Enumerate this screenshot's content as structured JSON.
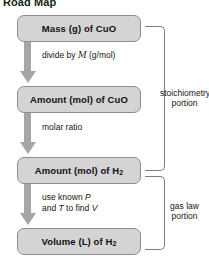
{
  "title": "Road Map",
  "nodes": [
    {
      "id": "mass-cuo",
      "text": "Mass (g) of CuO"
    },
    {
      "id": "mol-cuo",
      "text": "Amount (mol) of CuO"
    },
    {
      "id": "mol-h2",
      "text_main": "Amount (mol) of H",
      "subscript": "2"
    },
    {
      "id": "volume-h2",
      "text_main": "Volume (L) of H",
      "subscript": "2"
    }
  ],
  "steps": [
    {
      "id": "divide-by-molar-mass",
      "line1_pre": "divide by ",
      "symbol": "M",
      "line1_post": " (g/mol)"
    },
    {
      "id": "molar-ratio",
      "line1_pre": "molar ratio"
    },
    {
      "id": "use-known-p-t-find-v",
      "line1_pre": "use known ",
      "sym1": "P",
      "line2_pre": "and ",
      "sym2": "T",
      "line2_mid": " to find ",
      "sym3": "V"
    }
  ],
  "brackets": [
    {
      "id": "stoichiometry",
      "label_line1": "stoichiometry",
      "label_line2": "portion"
    },
    {
      "id": "gas-law",
      "label_line1": "gas law",
      "label_line2": "portion"
    }
  ],
  "colors": {
    "box_fill": "#d4d4d4",
    "box_border": "#8e8e8e",
    "arrow": "#a6a6a6",
    "bracket": "#7d7d7d",
    "text": "#111111"
  }
}
